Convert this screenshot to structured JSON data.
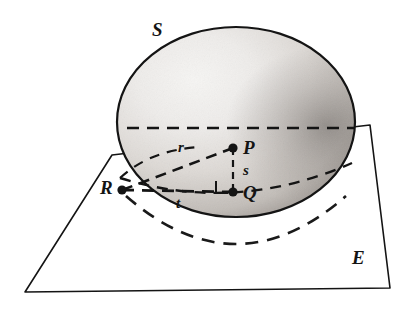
{
  "figure": {
    "background_color": "#ffffff",
    "ink_color": "#141414",
    "labels": {
      "sphere": "S",
      "plane": "E",
      "point_p": "P",
      "point_q": "Q",
      "point_r": "R",
      "segment_r": "r",
      "segment_s": "s",
      "segment_t": "t"
    },
    "label_positions": {
      "sphere": {
        "x": 152,
        "y": 20
      },
      "plane": {
        "x": 352,
        "y": 248
      },
      "point_p": {
        "x": 243,
        "y": 138
      },
      "point_q": {
        "x": 243,
        "y": 183
      },
      "point_r": {
        "x": 100,
        "y": 178
      },
      "segment_r": {
        "x": 178,
        "y": 140
      },
      "segment_s": {
        "x": 243,
        "y": 163
      },
      "segment_t": {
        "x": 176,
        "y": 196
      }
    },
    "geometry": {
      "sphere": {
        "center": {
          "x": 236,
          "y": 122
        },
        "radius_x": 119,
        "radius_y": 95,
        "shading": "light upper-left to dark right limb",
        "fill_light": "#f2f0ee",
        "fill_mid": "#cfcbc7",
        "fill_dark": "#8e8a86"
      },
      "points": {
        "P": {
          "x": 233,
          "y": 148
        },
        "Q": {
          "x": 233,
          "y": 192
        },
        "R": {
          "x": 122,
          "y": 190
        }
      },
      "plane_quad": [
        {
          "x": 112,
          "y": 155
        },
        {
          "x": 370,
          "y": 125
        },
        {
          "x": 390,
          "y": 288
        },
        {
          "x": 25,
          "y": 292
        }
      ],
      "equator_dashes": {
        "top_line_y": 128,
        "top_line_x1": 127,
        "top_line_x2": 355
      },
      "right_angle_marker": {
        "x": 216,
        "y": 181,
        "size": 12
      }
    }
  }
}
